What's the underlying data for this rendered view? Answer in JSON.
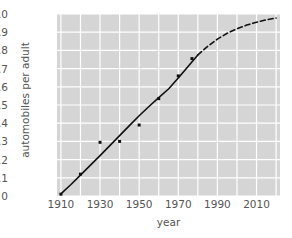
{
  "chart_data": {
    "type": "scatter",
    "title": "",
    "xlabel": "year",
    "ylabel": "automobiles per adult",
    "xlim": [
      1908,
      2022
    ],
    "ylim": [
      0,
      1.0
    ],
    "grid": true,
    "legend": "none",
    "xticks": [
      1910,
      1930,
      1950,
      1970,
      1990,
      2010
    ],
    "xticklabels": [
      "1910",
      "1930",
      "1950",
      "1970",
      "1990",
      "2010"
    ],
    "yticks": [
      0,
      0.1,
      0.2,
      0.3,
      0.4,
      0.5,
      0.6,
      0.7,
      0.8,
      0.9,
      1.0
    ],
    "yticklabels": [
      "0",
      "0.1",
      "0.2",
      "0.3",
      "0.4",
      "0.5",
      "0.6",
      "0.7",
      "0.8",
      "0.9",
      "1.0"
    ],
    "x_minor_gridlines": [
      1920,
      1940,
      1960,
      1980,
      2000,
      2020
    ],
    "series": [
      {
        "name": "observed",
        "type": "scatter",
        "marker": "square",
        "marker_size": 3,
        "color": "#111111",
        "points": [
          {
            "x": 1910,
            "y": 0.01
          },
          {
            "x": 1920,
            "y": 0.12
          },
          {
            "x": 1930,
            "y": 0.295
          },
          {
            "x": 1940,
            "y": 0.3
          },
          {
            "x": 1950,
            "y": 0.39
          },
          {
            "x": 1960,
            "y": 0.535
          },
          {
            "x": 1970,
            "y": 0.66
          },
          {
            "x": 1977,
            "y": 0.755
          }
        ]
      },
      {
        "name": "logistic fit",
        "type": "line",
        "style": "solid",
        "color": "#111111",
        "linewidth": 1.6,
        "points": [
          {
            "x": 1910,
            "y": 0.012
          },
          {
            "x": 1915,
            "y": 0.062
          },
          {
            "x": 1920,
            "y": 0.115
          },
          {
            "x": 1925,
            "y": 0.168
          },
          {
            "x": 1930,
            "y": 0.222
          },
          {
            "x": 1935,
            "y": 0.277
          },
          {
            "x": 1940,
            "y": 0.332
          },
          {
            "x": 1945,
            "y": 0.387
          },
          {
            "x": 1950,
            "y": 0.441
          },
          {
            "x": 1955,
            "y": 0.492
          },
          {
            "x": 1960,
            "y": 0.541
          },
          {
            "x": 1965,
            "y": 0.588
          },
          {
            "x": 1970,
            "y": 0.648
          },
          {
            "x": 1975,
            "y": 0.712
          },
          {
            "x": 1980,
            "y": 0.775
          }
        ]
      },
      {
        "name": "logistic extrapolation",
        "type": "line",
        "style": "dashed",
        "color": "#111111",
        "linewidth": 1.6,
        "dash_pattern": "5,3",
        "points": [
          {
            "x": 1980,
            "y": 0.775
          },
          {
            "x": 1985,
            "y": 0.822
          },
          {
            "x": 1990,
            "y": 0.862
          },
          {
            "x": 1995,
            "y": 0.894
          },
          {
            "x": 2000,
            "y": 0.919
          },
          {
            "x": 2005,
            "y": 0.939
          },
          {
            "x": 2010,
            "y": 0.955
          },
          {
            "x": 2015,
            "y": 0.968
          },
          {
            "x": 2020,
            "y": 0.978
          }
        ]
      }
    ]
  },
  "style": {
    "figure_background": "#ffffff",
    "axes_background": "#d5d5d5",
    "gridline_color": "#ffffff",
    "tick_label_color": "#555555",
    "data_color": "#111111"
  }
}
